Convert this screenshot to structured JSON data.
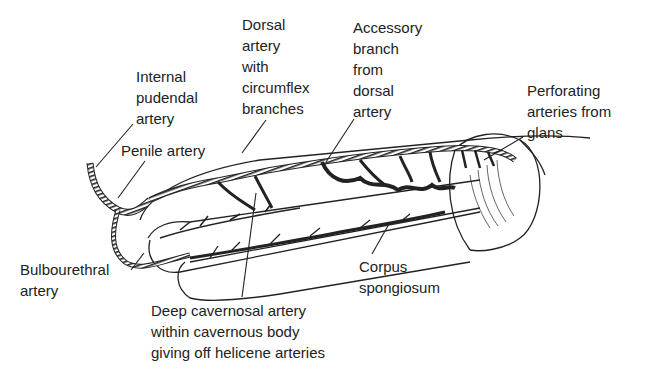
{
  "diagram": {
    "type": "anatomical illustration",
    "labels": {
      "internal_pudendal": "Internal\npudendal\nartery",
      "penile_artery": "Penile artery",
      "dorsal_artery": "Dorsal\nartery\nwith\ncircumflex\nbranches",
      "accessory_branch": "Accessory\nbranch\nfrom\ndorsal\nartery",
      "perforating": "Perforating\narteries from\nglans",
      "bulbourethral": "Bulbourethral\nartery",
      "deep_cavernosal": "Deep cavernosal artery\nwithin cavernous body\ngiving off helicene arteries",
      "corpus_spongiosum": "Corpus\nspongiosum"
    },
    "colors": {
      "line": "#222222",
      "background": "#ffffff"
    }
  }
}
